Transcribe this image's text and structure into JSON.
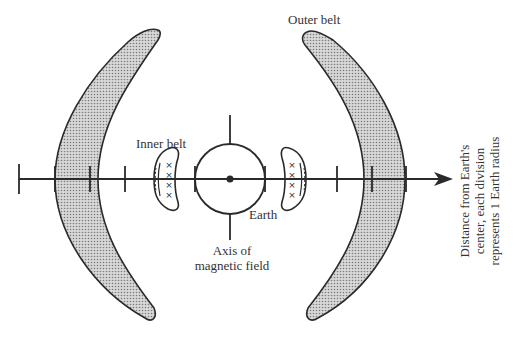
{
  "diagram": {
    "labels": {
      "outer_belt": "Outer belt",
      "inner_belt": "Inner belt",
      "earth": "Earth",
      "axis_line1": "Axis of",
      "axis_line2": "magnetic field",
      "distance_line1": "Distance from Earth's",
      "distance_line2": "center, each division",
      "distance_line3": "represents 1 Earth radius"
    },
    "axis": {
      "tick_spacing_earth_radii": 1,
      "ticks_each_side": 6
    },
    "colors": {
      "stroke": "#2a2a2a",
      "belt_fill": "#c9c9c9",
      "belt_dot": "#8a8a8a",
      "background": "#ffffff"
    },
    "markers": {
      "inner_belt_symbol": "×"
    }
  }
}
